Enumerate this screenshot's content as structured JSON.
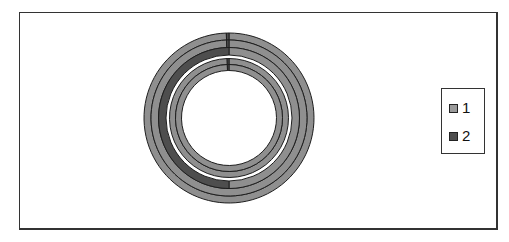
{
  "chart_data": {
    "type": "doughnut",
    "title": "",
    "legend_position": "right",
    "legend": [
      "1",
      "2"
    ],
    "colors": {
      "1": "#8f8f8f",
      "2": "#4e4e4e"
    },
    "rings": [
      {
        "ring": 1,
        "values": {
          "1": 99.5,
          "2": 0.5
        }
      },
      {
        "ring": 2,
        "values": {
          "1": 99.5,
          "2": 0.5
        }
      },
      {
        "ring": 3,
        "values": {
          "1": 50,
          "2": 50
        }
      },
      {
        "ring": 4,
        "values": {
          "1": 99.5,
          "2": 0.5
        }
      },
      {
        "ring": 5,
        "values": {
          "1": 99.5,
          "2": 0.5
        }
      }
    ],
    "ring_order": "outer to inner",
    "center": [
      229,
      118
    ]
  },
  "legend": {
    "items": [
      {
        "label": "1",
        "color": "#8f8f8f"
      },
      {
        "label": "2",
        "color": "#4e4e4e"
      }
    ]
  }
}
